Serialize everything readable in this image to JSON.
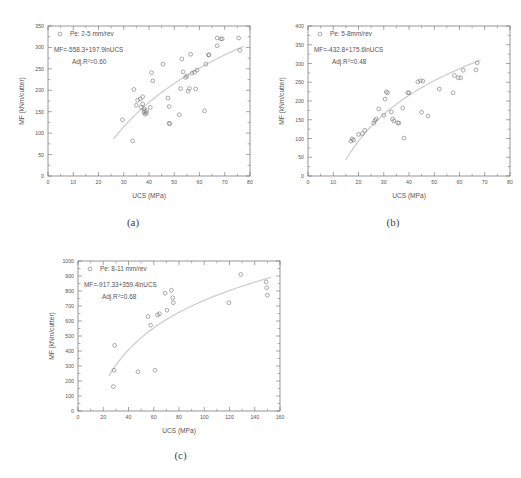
{
  "figure": {
    "panel_captions": [
      "(a)",
      "(b)",
      "(c)"
    ]
  },
  "chart_data": [
    {
      "id": "a",
      "type": "scatter",
      "title": "",
      "xlabel": "UCS (MPa)",
      "ylabel": "MF (kNm/cutter)",
      "legend_entry": "Pe: 2-5 mm/rev",
      "legend_position": "top-left",
      "equation": "MF=-558.3+197.9lnUCS",
      "r2_prefix": "Adj.R",
      "r2_sup": "2",
      "r2_text": "=0.60",
      "r2_value": 0.6,
      "fit": {
        "type": "logarithmic",
        "intercept": -558.3,
        "slope": 197.9
      },
      "xlim": [
        0,
        80
      ],
      "ylim": [
        0,
        350
      ],
      "xticks": [
        0,
        10,
        20,
        30,
        40,
        50,
        60,
        70,
        80
      ],
      "yticks": [
        0,
        50,
        100,
        150,
        200,
        250,
        300,
        350
      ],
      "grid": false,
      "points": [
        [
          29.5,
          131
        ],
        [
          33.5,
          82
        ],
        [
          34.0,
          202
        ],
        [
          35.0,
          165
        ],
        [
          35.5,
          177
        ],
        [
          36.5,
          180
        ],
        [
          37.0,
          160
        ],
        [
          37.5,
          168
        ],
        [
          37.5,
          185
        ],
        [
          38.0,
          148
        ],
        [
          38.0,
          157
        ],
        [
          38.2,
          152
        ],
        [
          38.5,
          144
        ],
        [
          39.0,
          152
        ],
        [
          39.0,
          147
        ],
        [
          40.5,
          160
        ],
        [
          41.0,
          241
        ],
        [
          41.5,
          222
        ],
        [
          45.5,
          261
        ],
        [
          47.5,
          182
        ],
        [
          48.0,
          162
        ],
        [
          48.0,
          123
        ],
        [
          48.2,
          122
        ],
        [
          52.0,
          143
        ],
        [
          52.5,
          204
        ],
        [
          53.0,
          273
        ],
        [
          53.5,
          243
        ],
        [
          54.5,
          230
        ],
        [
          55.0,
          233
        ],
        [
          55.5,
          198
        ],
        [
          56.0,
          204
        ],
        [
          56.5,
          284
        ],
        [
          57.0,
          240
        ],
        [
          58.0,
          242
        ],
        [
          58.5,
          203
        ],
        [
          59.0,
          247
        ],
        [
          62.0,
          152
        ],
        [
          62.5,
          261
        ],
        [
          63.5,
          282
        ],
        [
          63.8,
          283
        ],
        [
          67.0,
          304
        ],
        [
          67.0,
          322
        ],
        [
          68.5,
          320
        ],
        [
          69.0,
          320
        ],
        [
          75.5,
          322
        ],
        [
          76.0,
          293
        ]
      ]
    },
    {
      "id": "b",
      "type": "scatter",
      "title": "",
      "xlabel": "UCS (MPa)",
      "ylabel": "MF (kNm/cutter)",
      "legend_entry": "Pe: 5-8mm/rev",
      "legend_position": "top-left",
      "equation": "MF=-432.8+175.6lnUCS",
      "r2_prefix": "Adj.R",
      "r2_sup": "2",
      "r2_text": "=0.48",
      "r2_value": 0.48,
      "fit": {
        "type": "logarithmic",
        "intercept": -432.8,
        "slope": 175.6
      },
      "xlim": [
        0,
        80
      ],
      "ylim": [
        0,
        400
      ],
      "xticks": [
        0,
        10,
        20,
        30,
        40,
        50,
        60,
        70,
        80
      ],
      "yticks": [
        0,
        50,
        100,
        150,
        200,
        250,
        300,
        350,
        400
      ],
      "grid": false,
      "points": [
        [
          17.0,
          93
        ],
        [
          17.5,
          99
        ],
        [
          18.0,
          96
        ],
        [
          20.0,
          111
        ],
        [
          21.5,
          113
        ],
        [
          22.5,
          122
        ],
        [
          26.0,
          141
        ],
        [
          26.5,
          148
        ],
        [
          27.0,
          152
        ],
        [
          28.0,
          179
        ],
        [
          30.0,
          162
        ],
        [
          30.5,
          205
        ],
        [
          31.0,
          224
        ],
        [
          31.5,
          222
        ],
        [
          33.0,
          171
        ],
        [
          33.5,
          152
        ],
        [
          34.0,
          147
        ],
        [
          35.5,
          142
        ],
        [
          36.0,
          141
        ],
        [
          37.5,
          181
        ],
        [
          38.0,
          101
        ],
        [
          39.5,
          222
        ],
        [
          40.0,
          222
        ],
        [
          43.5,
          251
        ],
        [
          44.5,
          254
        ],
        [
          45.0,
          170
        ],
        [
          45.5,
          253
        ],
        [
          47.5,
          160
        ],
        [
          52.0,
          232
        ],
        [
          57.5,
          222
        ],
        [
          58.0,
          268
        ],
        [
          59.5,
          262
        ],
        [
          60.5,
          262
        ],
        [
          61.5,
          282
        ],
        [
          66.5,
          283
        ],
        [
          67.0,
          302
        ]
      ]
    },
    {
      "id": "c",
      "type": "scatter",
      "title": "",
      "xlabel": "UCS (MPa)",
      "ylabel": "MF (kNm/cutter)",
      "legend_entry": "Pe: 8-11 mm/rev",
      "legend_position": "top-left",
      "equation": "MF=-917.33+359.4lnUCS",
      "r2_prefix": "Adj.R",
      "r2_sup": "2",
      "r2_text": "=0.68",
      "r2_value": 0.68,
      "fit": {
        "type": "logarithmic",
        "intercept": -917.33,
        "slope": 359.4
      },
      "xlim": [
        0,
        160
      ],
      "ylim": [
        0,
        1000
      ],
      "xticks": [
        0,
        20,
        40,
        60,
        80,
        100,
        120,
        140,
        160
      ],
      "yticks": [
        0,
        100,
        200,
        300,
        400,
        500,
        600,
        700,
        800,
        900,
        1000
      ],
      "grid": false,
      "points": [
        [
          28.0,
          163
        ],
        [
          28.5,
          272
        ],
        [
          29.0,
          438
        ],
        [
          47.5,
          262
        ],
        [
          55.5,
          630
        ],
        [
          57.5,
          572
        ],
        [
          61.0,
          272
        ],
        [
          63.0,
          640
        ],
        [
          64.5,
          648
        ],
        [
          69.0,
          785
        ],
        [
          70.5,
          672
        ],
        [
          74.0,
          805
        ],
        [
          75.0,
          755
        ],
        [
          75.5,
          722
        ],
        [
          119.5,
          722
        ],
        [
          129.0,
          910
        ],
        [
          149.0,
          860
        ],
        [
          149.5,
          822
        ],
        [
          150.0,
          772
        ]
      ]
    }
  ]
}
